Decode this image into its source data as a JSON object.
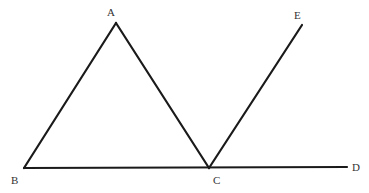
{
  "diagram": {
    "points": {
      "A": {
        "label": "A",
        "x": 116,
        "y": 23
      },
      "B": {
        "label": "B",
        "x": 24,
        "y": 168
      },
      "C": {
        "label": "C",
        "x": 209,
        "y": 168
      },
      "D": {
        "label": "D",
        "x": 347,
        "y": 167
      },
      "E": {
        "label": "E",
        "x": 302,
        "y": 25
      }
    },
    "segments": [
      {
        "from": "B",
        "to": "A"
      },
      {
        "from": "A",
        "to": "C"
      },
      {
        "from": "B",
        "to": "D"
      },
      {
        "from": "C",
        "to": "E"
      }
    ],
    "labels": {
      "A": "A",
      "B": "B",
      "C": "C",
      "D": "D",
      "E": "E"
    },
    "line_color": "#1a1a1a"
  }
}
